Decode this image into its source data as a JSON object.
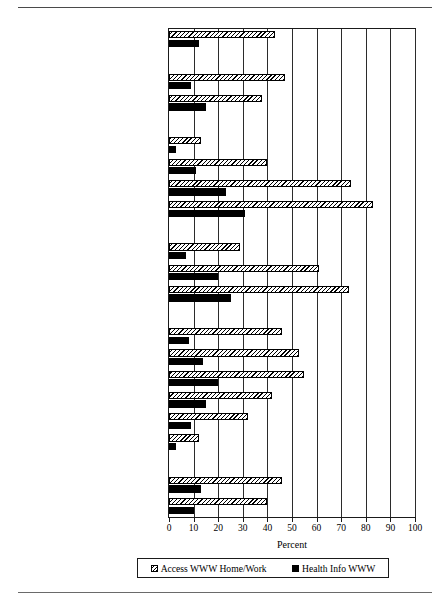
{
  "chart_data": {
    "type": "bar",
    "orientation": "horizontal",
    "title": "",
    "xlabel": "Percent",
    "ylabel": "",
    "xlim": [
      0,
      100
    ],
    "xticks": [
      0,
      10,
      20,
      30,
      40,
      50,
      60,
      70,
      80,
      90,
      100
    ],
    "grid": "vertical",
    "legend_position": "bottom",
    "legend": [
      "Access WWW Home/Work",
      "Health Info WWW"
    ],
    "categories": [
      "All adults",
      "GENDER",
      "Men",
      "Women",
      "EDUCATION",
      "Less than high school",
      "High school graduate",
      "Baccalaureate",
      "Graduate/Professional degree",
      "COLLEGE SCIENCE COURSES",
      "No college science",
      "1-2 yrs college science",
      "3 or more years college science",
      "AGE",
      "Age 18-24",
      "Age 25-34",
      "Age 35-44",
      "Age 45-54",
      "Age 55-64",
      "Age 65 and over",
      "CHILDREN AT HOME",
      "Children at home",
      "No children at home"
    ],
    "header_rows": [
      "GENDER",
      "EDUCATION",
      "COLLEGE SCIENCE COURSES",
      "AGE",
      "CHILDREN AT HOME"
    ],
    "series": [
      {
        "name": "Access WWW Home/Work",
        "pattern": "diagonal-hatch",
        "values": [
          43,
          null,
          47,
          38,
          null,
          13,
          40,
          74,
          83,
          null,
          29,
          61,
          73,
          null,
          46,
          53,
          55,
          42,
          32,
          12,
          null,
          46,
          40
        ]
      },
      {
        "name": "Health Info WWW",
        "pattern": "solid-black",
        "values": [
          12,
          null,
          9,
          15,
          null,
          3,
          11,
          23,
          31,
          null,
          7,
          20,
          25,
          null,
          8,
          14,
          20,
          15,
          9,
          3,
          null,
          13,
          10
        ]
      }
    ]
  }
}
